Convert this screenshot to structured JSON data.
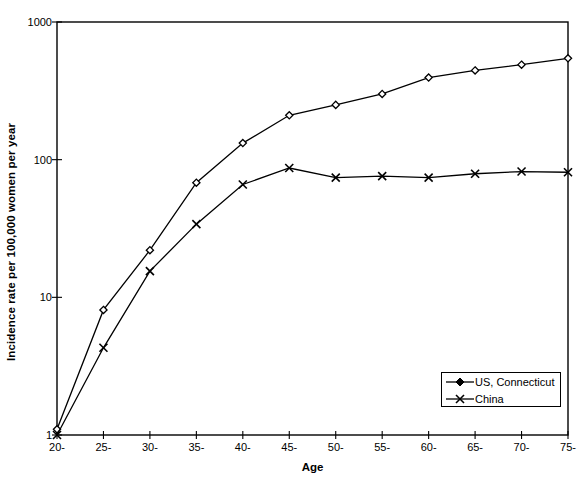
{
  "chart_data": {
    "type": "line",
    "title": "",
    "xlabel": "Age",
    "ylabel": "Incidence rate per 100,000 women per year",
    "yscale": "log",
    "ylim": [
      1,
      1000
    ],
    "ytick_labels": [
      "1000",
      "100",
      "10",
      "1"
    ],
    "ytick_values": [
      1000,
      100,
      10,
      1
    ],
    "grid": false,
    "legend_position": "bottom-right",
    "categories": [
      "20-",
      "25-",
      "30-",
      "35-",
      "40-",
      "45-",
      "50-",
      "55-",
      "60-",
      "65-",
      "70-",
      "75-"
    ],
    "series": [
      {
        "name": "US, Connecticut",
        "marker": "diamond",
        "color": "#000000",
        "values": [
          1.1,
          8.1,
          22,
          68,
          132,
          210,
          250,
          300,
          395,
          445,
          490,
          545
        ]
      },
      {
        "name": "China",
        "marker": "x",
        "color": "#000000",
        "values": [
          1.0,
          4.3,
          15.5,
          34,
          66,
          87,
          74,
          76,
          74,
          79,
          82,
          81
        ]
      }
    ]
  },
  "legend": {
    "items": [
      {
        "label": "US, Connecticut",
        "marker": "diamond"
      },
      {
        "label": "China",
        "marker": "x"
      }
    ]
  }
}
